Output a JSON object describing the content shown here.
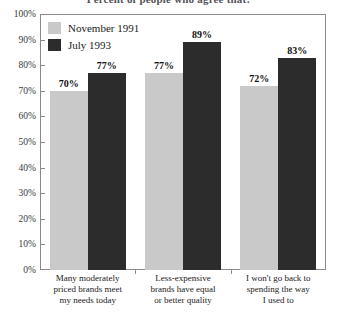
{
  "chart_data": {
    "type": "bar",
    "title": "Percent of people who agree that:",
    "xlabel": "",
    "ylabel": "",
    "ylim": [
      0,
      100
    ],
    "grid": false,
    "legend_position": "top-left",
    "categories": [
      "Many moderately priced brands meet my needs today",
      "Less-expensive brands have equal or better quality",
      "I won't go back to spending the way I used to"
    ],
    "category_lines": [
      [
        "Many moderately",
        "priced brands meet",
        "my needs today"
      ],
      [
        "Less-expensive",
        "brands have equal",
        "or better quality"
      ],
      [
        "I won't go back to",
        "spending the way",
        "I used to"
      ]
    ],
    "series": [
      {
        "name": "November 1991",
        "color": "#c9c9c9",
        "values": [
          70,
          77,
          72
        ]
      },
      {
        "name": "July 1993",
        "color": "#2c2c2c",
        "values": [
          77,
          89,
          83
        ]
      }
    ],
    "series_by_category": [
      {
        "november_1991": 70,
        "july_1993": 77
      },
      {
        "november_1991": 72,
        "july_1993": 89
      },
      {
        "november_1991": 72,
        "july_1993": 83
      }
    ],
    "value_labels": [
      "70%",
      "77%",
      "72%",
      "89%",
      "72%",
      "83%"
    ],
    "y_ticks": [
      "100%",
      "90%",
      "80%",
      "70%",
      "60%",
      "50%",
      "40%",
      "30%",
      "20%",
      "10%",
      "0%"
    ],
    "y_tick_values": [
      100,
      90,
      80,
      70,
      60,
      50,
      40,
      30,
      20,
      10,
      0
    ]
  },
  "legend": {
    "items": [
      {
        "label": "November 1991",
        "swatch": "series-a"
      },
      {
        "label": "July 1993",
        "swatch": "series-b"
      }
    ]
  },
  "colors": {
    "series_a": "#c9c9c9",
    "series_b": "#2c2c2c",
    "frame": "#8a8a8f",
    "background": "#ffffff"
  }
}
